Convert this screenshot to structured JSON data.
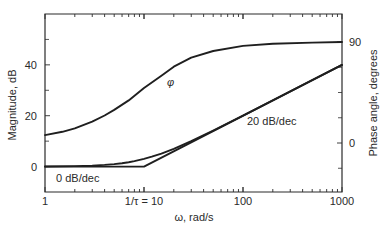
{
  "chart_data": {
    "type": "line",
    "title": "",
    "xlabel": "ω, rad/s",
    "ylabel": "Magnitude, dB",
    "y2label": "Phase angle, degrees",
    "xscale": "log",
    "xlim": [
      1,
      1000
    ],
    "ylim": [
      -10,
      60
    ],
    "y2lim": [
      -22.5,
      135
    ],
    "grid": false,
    "legend": "none",
    "x_ticks": [
      {
        "value": 1,
        "label": "1"
      },
      {
        "value": 10,
        "label": "1/τ = 10"
      },
      {
        "value": 100,
        "label": "100"
      },
      {
        "value": 1000,
        "label": "1000"
      }
    ],
    "y_ticks": [
      {
        "value": 0,
        "label": "0"
      },
      {
        "value": 20,
        "label": "20"
      },
      {
        "value": 40,
        "label": "40"
      }
    ],
    "y_minor_ticks": [
      10,
      30,
      50
    ],
    "y2_ticks": [
      {
        "value": 0,
        "label": "0"
      },
      {
        "value": 90,
        "label": "90"
      }
    ],
    "y2_minor_ticks": [
      -22.5,
      22.5,
      45,
      67.5
    ],
    "series": [
      {
        "name": "Magnitude (exact)",
        "axis": "left",
        "x": [
          1,
          2,
          3,
          4,
          5,
          6,
          7,
          8,
          10,
          12,
          15,
          20,
          30,
          50,
          100,
          200,
          500,
          1000
        ],
        "values": [
          0.04,
          0.17,
          0.37,
          0.64,
          0.97,
          1.34,
          1.73,
          2.15,
          3.01,
          3.87,
          5.12,
          6.99,
          10.0,
          14.15,
          20.04,
          26.03,
          33.98,
          40.0
        ]
      },
      {
        "name": "Magnitude (asymptote)",
        "axis": "left",
        "x": [
          1,
          10,
          1000
        ],
        "values": [
          0,
          0,
          40
        ]
      },
      {
        "name": "φ (phase)",
        "axis": "right",
        "x": [
          1,
          1.5,
          2,
          3,
          4,
          5,
          7,
          10,
          15,
          20,
          30,
          50,
          100,
          200,
          500,
          1000
        ],
        "values": [
          7,
          10,
          13,
          19,
          24.5,
          29.5,
          38,
          49,
          60,
          68,
          76,
          82,
          86.5,
          88.5,
          89.5,
          90
        ]
      }
    ],
    "annotations": [
      {
        "text": "φ",
        "x": 18,
        "y_right": 55
      },
      {
        "text": "20 dB/dec",
        "x": 110,
        "y": 9
      },
      {
        "text": "0 dB/dec",
        "x": 1.5,
        "y": -5
      }
    ],
    "parameters": {
      "tau": 0.1,
      "corner_frequency": 10
    }
  }
}
